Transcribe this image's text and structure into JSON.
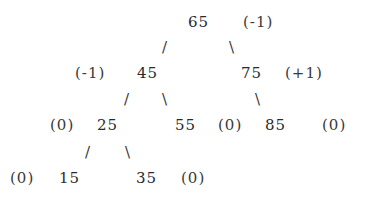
{
  "diagram": {
    "type": "avl-tree",
    "nodes": [
      {
        "key": "65",
        "balance": "(-1)",
        "x": 188,
        "y": 13,
        "bx": 243,
        "by": 13
      },
      {
        "key": "45",
        "balance": "(-1)",
        "x": 137,
        "y": 64,
        "bx": 75,
        "by": 64
      },
      {
        "key": "75",
        "balance": "(+1)",
        "x": 241,
        "y": 64,
        "bx": 285,
        "by": 64
      },
      {
        "key": "25",
        "balance": "(0)",
        "x": 97,
        "y": 116,
        "bx": 50,
        "by": 116
      },
      {
        "key": "55",
        "balance": "(0)",
        "x": 175,
        "y": 116,
        "bx": 218,
        "by": 116
      },
      {
        "key": "85",
        "balance": "(0)",
        "x": 265,
        "y": 116,
        "bx": 322,
        "by": 116
      },
      {
        "key": "15",
        "balance": "(0)",
        "x": 59,
        "y": 169,
        "bx": 10,
        "by": 169
      },
      {
        "key": "35",
        "balance": "(0)",
        "x": 136,
        "y": 169,
        "bx": 181,
        "by": 169
      }
    ],
    "edges": [
      {
        "glyph": "/",
        "from": "65",
        "to": "45",
        "x": 162,
        "y": 38
      },
      {
        "glyph": "\\",
        "from": "65",
        "to": "75",
        "x": 229,
        "y": 38
      },
      {
        "glyph": "/",
        "from": "45",
        "to": "25",
        "x": 124,
        "y": 90
      },
      {
        "glyph": "\\",
        "from": "45",
        "to": "55",
        "x": 162,
        "y": 90
      },
      {
        "glyph": "\\",
        "from": "75",
        "to": "85",
        "x": 255,
        "y": 90
      },
      {
        "glyph": "/",
        "from": "25",
        "to": "15",
        "x": 85,
        "y": 143
      },
      {
        "glyph": "\\",
        "from": "25",
        "to": "35",
        "x": 125,
        "y": 143
      }
    ]
  }
}
